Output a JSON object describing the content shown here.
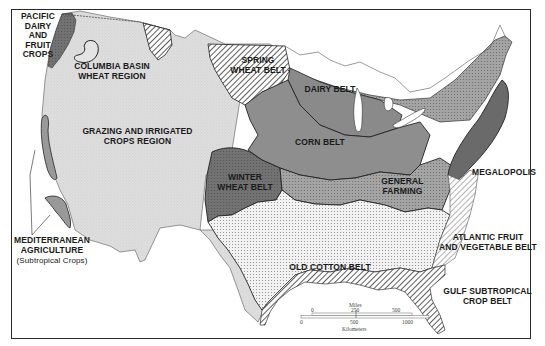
{
  "map": {
    "title": "Agricultural Regions of the United States",
    "colors": {
      "background": "#ffffff",
      "frame": "#2a2a2a",
      "grazing": "#dcdcdc",
      "corn_belt": "#8e8e8e",
      "dairy_belt": "#8a8a8a",
      "winter_wheat": "#6e6e6e",
      "general_farming": "#a2a2a2",
      "old_cotton": "#ececec",
      "megalopolis": "#6a6a6a",
      "pacific_dairy": "#7a7a7a",
      "mediterranean": "#9a9a9a",
      "hatch": "#333333"
    },
    "regions": [
      {
        "id": "pacific-dairy",
        "label": "PACIFIC\nDAIRY\nAND\nFRUIT\nCROPS"
      },
      {
        "id": "columbia-basin",
        "label": "COLUMBIA BASIN\nWHEAT REGION"
      },
      {
        "id": "spring-wheat",
        "label": "SPRING\nWHEAT BELT"
      },
      {
        "id": "dairy-belt",
        "label": "DAIRY BELT"
      },
      {
        "id": "grazing",
        "label": "GRAZING AND IRRIGATED\nCROPS REGION"
      },
      {
        "id": "corn-belt",
        "label": "CORN BELT"
      },
      {
        "id": "winter-wheat",
        "label": "WINTER\nWHEAT BELT"
      },
      {
        "id": "general-farming",
        "label": "GENERAL\nFARMING"
      },
      {
        "id": "megalopolis",
        "label": "MEGALOPOLIS"
      },
      {
        "id": "mediterranean",
        "label": "MEDITERRANEAN\nAGRICULTURE",
        "sublabel": "(Subtropical Crops)"
      },
      {
        "id": "atlantic-fruit",
        "label": "ATLANTIC FRUIT\nAND VEGETABLE BELT"
      },
      {
        "id": "old-cotton",
        "label": "OLD COTTON BELT"
      },
      {
        "id": "gulf-subtropical",
        "label": "GULF SUBTROPICAL\nCROP BELT"
      }
    ],
    "scale": {
      "miles_label": "Miles",
      "miles_ticks": [
        "0",
        "250",
        "500"
      ],
      "km_label": "Kilometers",
      "km_ticks": [
        "0",
        "500",
        "1000"
      ]
    }
  }
}
